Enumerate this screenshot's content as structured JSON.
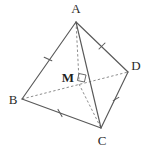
{
  "figure": {
    "caption": "Tetrahedron ABCD with interior point M",
    "background_color": "#ffffff",
    "solid_edge_color": "#595959",
    "dashed_edge_color": "#8c8c8c",
    "label_color": "#2a2a2a",
    "width": 146,
    "height": 149
  },
  "labels": {
    "apex": "A",
    "left": "B",
    "bottom": "C",
    "right": "D",
    "interior": "M"
  },
  "points": {
    "A": {
      "x": 76,
      "y": 22
    },
    "B": {
      "x": 22,
      "y": 99
    },
    "C": {
      "x": 101,
      "y": 128
    },
    "D": {
      "x": 128,
      "y": 72
    },
    "M": {
      "x": 79,
      "y": 80
    }
  },
  "label_positions": {
    "A": {
      "x": 76,
      "y": 13
    },
    "B": {
      "x": 13,
      "y": 104
    },
    "C": {
      "x": 102,
      "y": 145
    },
    "D": {
      "x": 136,
      "y": 70
    },
    "M": {
      "x": 68,
      "y": 82
    }
  },
  "edges": [
    {
      "name": "AB",
      "from": "A",
      "to": "B",
      "style": "solid",
      "tick": 1
    },
    {
      "name": "AD",
      "from": "A",
      "to": "D",
      "style": "solid",
      "tick": 1
    },
    {
      "name": "AC",
      "from": "A",
      "to": "C",
      "style": "solid",
      "tick": 0
    },
    {
      "name": "BC",
      "from": "B",
      "to": "C",
      "style": "solid",
      "tick": 1
    },
    {
      "name": "DC",
      "from": "D",
      "to": "C",
      "style": "solid",
      "tick": 1
    },
    {
      "name": "BD",
      "from": "B",
      "to": "D",
      "style": "dashed",
      "tick": 0
    },
    {
      "name": "AM",
      "from": "A",
      "to": "M",
      "style": "dashed",
      "tick": 0
    },
    {
      "name": "MC",
      "from": "M",
      "to": "C",
      "style": "dashed",
      "tick": 0
    }
  ],
  "tick_marks": [
    {
      "edge": "AB",
      "x": 48,
      "y": 59
    },
    {
      "edge": "AD",
      "x": 102,
      "y": 46
    },
    {
      "edge": "BC",
      "x": 60,
      "y": 113
    },
    {
      "edge": "DC",
      "x": 116,
      "y": 99
    }
  ],
  "right_angle_marker": {
    "at": "M",
    "size": 7,
    "description": "right angle at M between AM and the base plane"
  }
}
